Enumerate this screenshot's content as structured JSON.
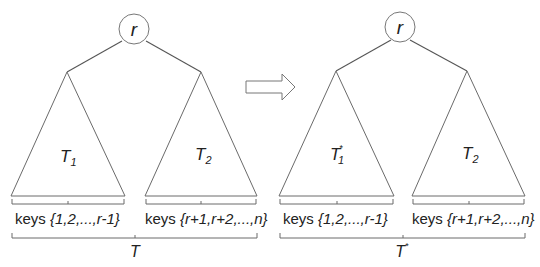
{
  "diagram": {
    "type": "binary-search-tree-transformation",
    "colors": {
      "line": "#555555",
      "background": "#ffffff",
      "text": "#222222"
    },
    "left_tree": {
      "root": {
        "label": "r"
      },
      "left_subtree": {
        "name": "T",
        "subscript": "1",
        "superscript": ""
      },
      "right_subtree": {
        "name": "T",
        "subscript": "2",
        "superscript": ""
      },
      "left_keys": {
        "prefix": "keys ",
        "set": "{1,2,...,r-1}"
      },
      "right_keys": {
        "prefix": "keys ",
        "set": "{r+1,r+2,...,n}"
      },
      "tree_label": {
        "name": "T",
        "superscript": ""
      }
    },
    "arrow": {
      "direction": "right",
      "icon": "hollow-right-arrow"
    },
    "right_tree": {
      "root": {
        "label": "r"
      },
      "left_subtree": {
        "name": "T",
        "subscript": "1",
        "superscript": "*"
      },
      "right_subtree": {
        "name": "T",
        "subscript": "2",
        "superscript": ""
      },
      "left_keys": {
        "prefix": "keys ",
        "set": "{1,2,...,r-1}"
      },
      "right_keys": {
        "prefix": "keys ",
        "set": "{r+1,r+2,...,n}"
      },
      "tree_label": {
        "name": "T",
        "superscript": "*"
      }
    }
  }
}
